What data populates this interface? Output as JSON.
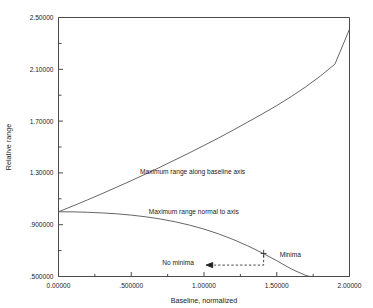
{
  "chart_data": {
    "type": "line",
    "title": "",
    "xlabel": "Baseline, normalized",
    "ylabel": "Relative range",
    "xlim": [
      0.0,
      2.0
    ],
    "ylim": [
      0.5,
      2.5
    ],
    "grid": false,
    "legend_position": "inline-annotations",
    "x_tick_labels": [
      "0.00000",
      ".500000",
      "1.00000",
      "1.50000",
      "2.00000"
    ],
    "x_tick_values": [
      0.0,
      0.5,
      1.0,
      1.5,
      2.0
    ],
    "x_minor_tick_values": [
      0.25,
      0.75,
      1.25,
      1.75
    ],
    "y_tick_labels": [
      "2.50000",
      "2.10000",
      "1.70000",
      "1.30000",
      ".900000",
      ".500000"
    ],
    "y_tick_values": [
      2.5,
      2.1,
      1.7,
      1.3,
      0.9,
      0.5
    ],
    "y_minor_tick_values": [
      2.3,
      1.9,
      1.5,
      1.1,
      0.7
    ],
    "series": [
      {
        "name": "Maximum range along baseline axis",
        "x": [
          0.0,
          0.1,
          0.2,
          0.3,
          0.4,
          0.5,
          0.6,
          0.7,
          0.8,
          0.9,
          1.0,
          1.1,
          1.2,
          1.3,
          1.4,
          1.5,
          1.6,
          1.7,
          1.8,
          1.9,
          2.0
        ],
        "y": [
          1.0,
          1.045,
          1.092,
          1.14,
          1.19,
          1.24,
          1.292,
          1.345,
          1.4,
          1.455,
          1.512,
          1.57,
          1.63,
          1.692,
          1.755,
          1.82,
          1.89,
          1.965,
          2.048,
          2.14,
          2.41
        ]
      },
      {
        "name": "Maximum range normal to axis",
        "x": [
          0.0,
          0.1,
          0.2,
          0.3,
          0.4,
          0.5,
          0.6,
          0.7,
          0.8,
          0.9,
          1.0,
          1.1,
          1.2,
          1.3,
          1.4,
          1.5,
          1.6,
          1.7,
          1.73
        ],
        "y": [
          1.0,
          0.999,
          0.996,
          0.991,
          0.984,
          0.974,
          0.961,
          0.944,
          0.923,
          0.897,
          0.866,
          0.829,
          0.786,
          0.737,
          0.682,
          0.622,
          0.558,
          0.508,
          0.5
        ]
      }
    ],
    "annotations": [
      {
        "name": "upper-curve-label",
        "text": "Maximum range along baseline axis",
        "x": 0.56,
        "y": 1.295
      },
      {
        "name": "lower-curve-label",
        "text": "Maximum range normal to axis",
        "x": 0.62,
        "y": 0.985
      },
      {
        "name": "no-minima-label",
        "text": "No minima",
        "x": 0.93,
        "y": 0.588
      },
      {
        "name": "minima-label",
        "text": "Minima",
        "x": 1.52,
        "y": 0.648
      }
    ],
    "marker_points": [
      {
        "name": "minima-boundary-marker",
        "symbol": "+",
        "x": 1.41,
        "y": 0.678
      }
    ]
  },
  "icons": {
    "arrow_left": "arrow-left-icon",
    "cross_marker": "plus-marker-icon"
  },
  "colors": {
    "background": "#ffffff",
    "axis": "#4a4a4a",
    "curve": "#555555",
    "text": "#1b1b1b",
    "dashed": "#333333"
  }
}
